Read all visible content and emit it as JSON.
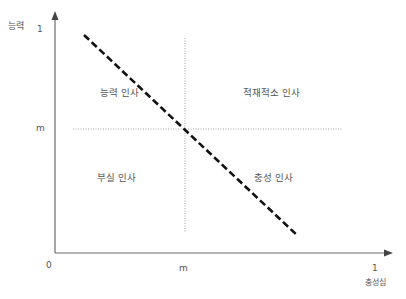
{
  "diagram": {
    "type": "quadrant",
    "y_axis": {
      "label": "능력",
      "max_tick": "1",
      "mid_tick": "m"
    },
    "x_axis": {
      "label": "충성심",
      "max_tick": "1",
      "mid_tick": "m",
      "origin": "0"
    },
    "quadrants": {
      "top_left": "능력 인사",
      "top_right": "적재적소 인사",
      "bottom_left": "부실 인사",
      "bottom_right": "충성 인사"
    },
    "colors": {
      "axis": "#6b6b6b",
      "dashed_line": "#111111",
      "dotted_line": "#9a9a9a",
      "text": "#555555"
    }
  }
}
